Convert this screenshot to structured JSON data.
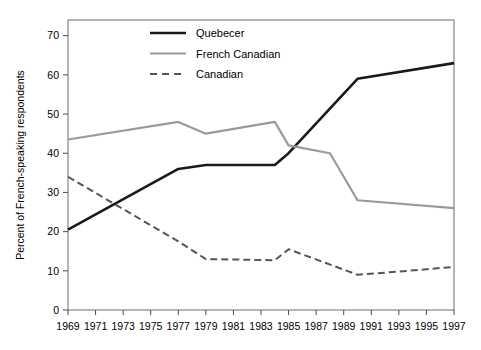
{
  "chart_data": {
    "type": "line",
    "title": "",
    "subtitle": "",
    "xlabel": "",
    "ylabel": "Percent of French-speaking respondents",
    "xlim": [
      1969,
      1997
    ],
    "ylim": [
      0,
      74
    ],
    "ytick_max_label": 70,
    "grid": false,
    "legend_position": "top-center",
    "x": [
      1969,
      1970,
      1977,
      1979,
      1984,
      1985,
      1986,
      1988,
      1990,
      1997
    ],
    "xticks": [
      1969,
      1971,
      1973,
      1975,
      1977,
      1979,
      1981,
      1983,
      1985,
      1987,
      1989,
      1991,
      1993,
      1995,
      1997
    ],
    "xtick_labels": [
      "1969",
      "1971",
      "1973",
      "1975",
      "1977",
      "1979",
      "1981",
      "1983",
      "1985",
      "1987",
      "1989",
      "1991",
      "1993",
      "1995",
      "1997"
    ],
    "yticks": [
      0,
      10,
      20,
      30,
      40,
      50,
      60,
      70
    ],
    "ytick_labels": [
      "0",
      "10",
      "20",
      "30",
      "40",
      "50",
      "60",
      "70"
    ],
    "series": [
      {
        "name": "Quebecer",
        "color": "#1a1a1a",
        "style": "solid",
        "width": 2.6,
        "points": [
          {
            "x": 1969,
            "y": 20.5
          },
          {
            "x": 1977,
            "y": 36.0
          },
          {
            "x": 1979,
            "y": 37.0
          },
          {
            "x": 1984,
            "y": 37.0
          },
          {
            "x": 1985,
            "y": 40.0
          },
          {
            "x": 1990,
            "y": 59.0
          },
          {
            "x": 1997,
            "y": 63.0
          }
        ]
      },
      {
        "name": "French Canadian",
        "color": "#9a9a9a",
        "style": "solid",
        "width": 2.2,
        "points": [
          {
            "x": 1969,
            "y": 43.5
          },
          {
            "x": 1977,
            "y": 48.0
          },
          {
            "x": 1979,
            "y": 45.0
          },
          {
            "x": 1984,
            "y": 48.0
          },
          {
            "x": 1985,
            "y": 42.0
          },
          {
            "x": 1988,
            "y": 40.0
          },
          {
            "x": 1990,
            "y": 28.0
          },
          {
            "x": 1997,
            "y": 26.0
          }
        ]
      },
      {
        "name": "Canadian",
        "color": "#555555",
        "style": "dashed",
        "width": 2.0,
        "points": [
          {
            "x": 1969,
            "y": 34.0
          },
          {
            "x": 1977,
            "y": 17.5
          },
          {
            "x": 1979,
            "y": 13.0
          },
          {
            "x": 1984,
            "y": 12.7
          },
          {
            "x": 1985,
            "y": 15.5
          },
          {
            "x": 1990,
            "y": 9.0
          },
          {
            "x": 1993,
            "y": 9.8
          },
          {
            "x": 1997,
            "y": 11.0
          }
        ]
      }
    ]
  },
  "legend": {
    "entries": [
      {
        "label": "Quebecer"
      },
      {
        "label": "French Canadian"
      },
      {
        "label": "Canadian"
      }
    ]
  },
  "axes": {
    "y_title": "Percent of French-speaking respondents"
  },
  "colors": {
    "quebecer": "#1a1a1a",
    "french_canadian": "#9a9a9a",
    "canadian": "#555555",
    "frame": "#7a7a7a",
    "background": "#ffffff"
  }
}
